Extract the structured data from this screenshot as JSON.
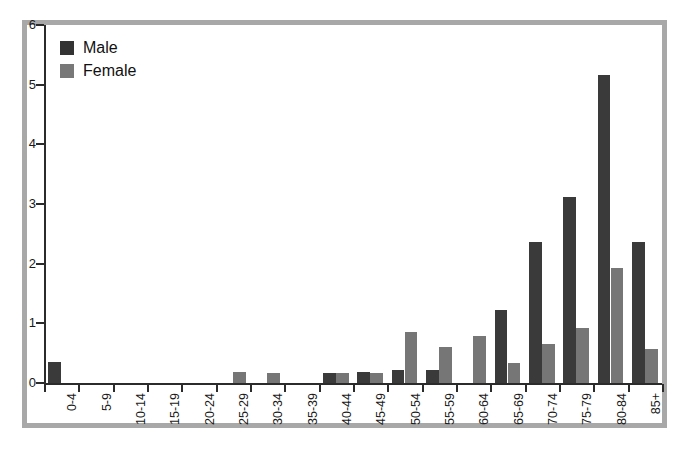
{
  "chart_data": {
    "type": "bar",
    "title": "",
    "subtitle": "",
    "xlabel": "",
    "ylabel": "",
    "ylim": [
      0,
      6
    ],
    "yticks": [
      0,
      1,
      2,
      3,
      4,
      5,
      6
    ],
    "grid": false,
    "legend_position": "top-left",
    "categories": [
      "0-4",
      "5-9",
      "10-14",
      "15-19",
      "20-24",
      "25-29",
      "30-34",
      "35-39",
      "40-44",
      "45-49",
      "50-54",
      "55-59",
      "60-64",
      "65-69",
      "70-74",
      "75-79",
      "80-84",
      "85+"
    ],
    "series": [
      {
        "name": "Male",
        "color": "#3a3a3a",
        "values": [
          0.35,
          0,
          0,
          0,
          0,
          0,
          0,
          0,
          0.17,
          0.19,
          0.22,
          0.22,
          0,
          1.23,
          2.37,
          3.12,
          5.16,
          2.37
        ]
      },
      {
        "name": "Female",
        "color": "#767676",
        "values": [
          0,
          0,
          0,
          0,
          0,
          0.18,
          0.17,
          0,
          0.16,
          0.16,
          0.85,
          0.6,
          0.78,
          0.34,
          0.65,
          0.92,
          1.93,
          0.57
        ]
      }
    ]
  },
  "legend": {
    "items": [
      {
        "label": "Male",
        "swatch": "male-swatch"
      },
      {
        "label": "Female",
        "swatch": "female-swatch"
      }
    ]
  },
  "colors": {
    "male": "#3a3a3a",
    "female": "#767676",
    "frame": "#a8a8a8",
    "axis": "#2b2b2b",
    "plot_background": "#ffffff"
  }
}
